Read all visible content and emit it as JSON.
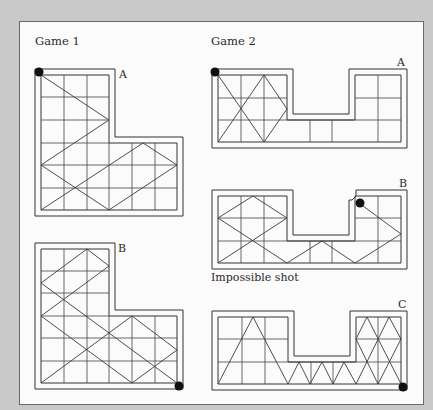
{
  "headings": {
    "game1": "Game 1",
    "game2": "Game 2"
  },
  "tables": {
    "game1_a": {
      "label": "A"
    },
    "game1_b": {
      "label": "B"
    },
    "game2_a": {
      "label": "A"
    },
    "game2_b": {
      "label": "B",
      "caption": "Impossible shot"
    },
    "game2_c": {
      "label": "C"
    }
  },
  "colors": {
    "background": "#c9c9c9",
    "panel": "#fbfbfb",
    "line": "#333333",
    "ball": "#111111"
  },
  "diagram": {
    "game1_a": {
      "shape": "L-shaped table, 6x6 grid, top 3 rows are 3 columns wide",
      "ball_start": "top-left corner",
      "path": [
        [
          41,
          75
        ],
        [
          109,
          120
        ],
        [
          41,
          165
        ],
        [
          109,
          210
        ],
        [
          177,
          165
        ],
        [
          143,
          143
        ],
        [
          41,
          210
        ]
      ]
    },
    "game1_b": {
      "shape": "L-shaped table, 6x6 grid, top 3 rows are 3 columns wide",
      "ball_start": "bottom-right corner",
      "path": [
        [
          177,
          383
        ],
        [
          41,
          283
        ],
        [
          87,
          249
        ],
        [
          109,
          266
        ],
        [
          41,
          316
        ],
        [
          132,
          383
        ],
        [
          177,
          350
        ],
        [
          132,
          316
        ],
        [
          41,
          383
        ]
      ]
    },
    "game2_a": {
      "shape": "U-shaped table, 8x3 grid, middle 3 columns only bottom row",
      "ball_start": "top-left corner",
      "path": [
        [
          218,
          75
        ],
        [
          264,
          142
        ],
        [
          287,
          109
        ],
        [
          264,
          75
        ],
        [
          218,
          142
        ]
      ]
    },
    "game2_b": {
      "shape": "U-shaped table, 8x3 grid, middle 3 columns only bottom row",
      "ball_start": "inner top-left corner of right block",
      "path": [
        [
          356,
          196
        ],
        [
          401,
          230
        ],
        [
          355,
          263
        ],
        [
          322,
          241
        ],
        [
          287,
          263
        ],
        [
          218,
          218
        ],
        [
          253,
          196
        ],
        [
          287,
          218
        ],
        [
          218,
          263
        ]
      ]
    },
    "game2_c": {
      "shape": "U-shaped table, 8x3 grid, middle 3 columns only bottom row",
      "ball_start": "bottom-right corner",
      "path": [
        [
          401,
          384
        ],
        [
          367,
          317
        ],
        [
          356,
          339
        ],
        [
          378,
          384
        ],
        [
          401,
          339
        ],
        [
          389,
          317
        ],
        [
          356,
          384
        ],
        [
          344,
          362
        ],
        [
          333,
          384
        ],
        [
          322,
          362
        ],
        [
          310,
          384
        ],
        [
          299,
          362
        ],
        [
          288,
          384
        ],
        [
          253,
          317
        ],
        [
          218,
          384
        ]
      ]
    }
  }
}
